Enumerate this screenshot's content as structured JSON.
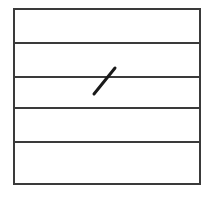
{
  "canvas": {
    "width": 211,
    "height": 207,
    "background_color": "#ffffff"
  },
  "figure": {
    "name": "ruled-box-with-slash-mark",
    "stroke_color": "#3a3a3a",
    "mark_color": "#1a1a1a",
    "border": {
      "x1": 14,
      "y1": 9,
      "x2": 200,
      "y2": 184,
      "stroke_width": 2
    },
    "rules": [
      {
        "label": "rule-1",
        "y": 43,
        "x1": 14,
        "x2": 200,
        "stroke_width": 2
      },
      {
        "label": "rule-2",
        "y": 77,
        "x1": 14,
        "x2": 200,
        "stroke_width": 2
      },
      {
        "label": "rule-3",
        "y": 108,
        "x1": 14,
        "x2": 200,
        "stroke_width": 2
      },
      {
        "label": "rule-4",
        "y": 142,
        "x1": 14,
        "x2": 200,
        "stroke_width": 2
      }
    ],
    "bands": [
      {
        "label": "band-1",
        "top": 9,
        "bottom": 43
      },
      {
        "label": "band-2",
        "top": 43,
        "bottom": 77
      },
      {
        "label": "band-3",
        "top": 77,
        "bottom": 108
      },
      {
        "label": "band-4",
        "top": 108,
        "bottom": 142
      },
      {
        "label": "band-5",
        "top": 142,
        "bottom": 184
      }
    ],
    "slash_mark": {
      "label": "diagonal-slash-mark",
      "x1": 94,
      "y1": 94,
      "x2": 115,
      "y2": 68,
      "stroke_width": 3,
      "crosses_rule": "rule-2"
    }
  }
}
